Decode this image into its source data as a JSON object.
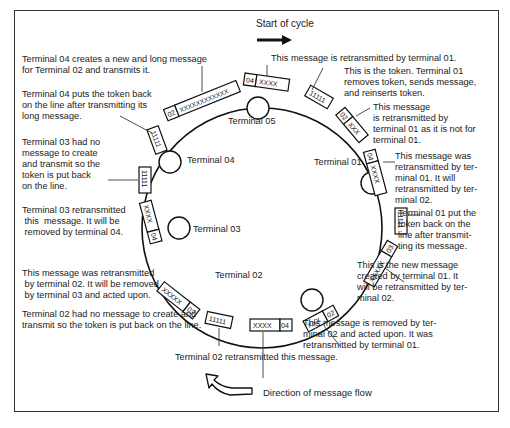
{
  "header": {
    "start_label": "Start of cycle"
  },
  "footer": {
    "direction_label": "Direction of message flow"
  },
  "terminals": [
    {
      "id": "05",
      "label": "Terminal 05"
    },
    {
      "id": "01",
      "label": "Terminal 01"
    },
    {
      "id": "02",
      "label": "Terminal 02"
    },
    {
      "id": "03",
      "label": "Terminal 03"
    },
    {
      "id": "04",
      "label": "Terminal 04"
    }
  ],
  "frames": [
    {
      "addr": "04",
      "payload": "XXXX"
    },
    {
      "addr": "",
      "payload": "11111"
    },
    {
      "addr": "02",
      "payload": "XXX"
    },
    {
      "addr": "04",
      "payload": "XXXX"
    },
    {
      "addr": "",
      "payload": "11111"
    },
    {
      "addr": "03",
      "payload": "XXXXX"
    },
    {
      "addr": "02",
      "payload": "XXX"
    },
    {
      "addr": "04",
      "payload": "XXXX"
    },
    {
      "addr": "",
      "payload": "11111"
    },
    {
      "addr": "03",
      "payload": "XXXXX"
    },
    {
      "addr": "04",
      "payload": "XXXX"
    },
    {
      "addr": "",
      "payload": "11111"
    },
    {
      "addr": "",
      "payload": "11111"
    },
    {
      "addr": "02",
      "payload": "XXXXXXXXXXXX"
    }
  ],
  "annotations": {
    "t04_new_message": "Terminal 04 creates a new and long message\nfor Terminal 02 and transmits it.",
    "t04_token_back": "Terminal 04 puts the token back\non the line after transmitting its\nlong message.",
    "t03_no_message": "Terminal 03 had no\nmessage to create\nand transmit so the\ntoken is put back\non the line.",
    "t03_retransmitted": "Terminal 03 retransmitted\n this  message. It will be\n removed by terminal 04.",
    "t02_retransmitted_removed_03": "This message was retransmitted\n by terminal 02. It will be removed\n by terminal 03 and acted upon.",
    "t02_no_message": "Terminal 02 had no message to create and\ntransmit so the token is put back on the line.",
    "t02_retransmitted": "Terminal 02 retransmitted this message.",
    "retrans_by_01": "This message is retransmitted by terminal 01.",
    "token_01": "This is the token. Terminal 01\nremoves token, sends message,\nand reinserts token.",
    "not_for_01": "This message\nis retransmitted by\nterminal 01 as it is not for\nterminal 01.",
    "retrans_01_then_02": "This message was\nretransmitted by ter-\nminal 01. It will\nretransmitted by ter-\nminal 02.",
    "t01_token_back": "Terminal 01 put the\ntoken back on the\nline after transmit-\nting its message.",
    "new_from_01": "This is the new message\ncreated by terminal 01. It\nwill be retransmitted by ter-\nminal 02.",
    "removed_by_02": "This message is removed by ter-\nminal 02 and acted upon. It was\nretransmitted by terminal 01."
  }
}
